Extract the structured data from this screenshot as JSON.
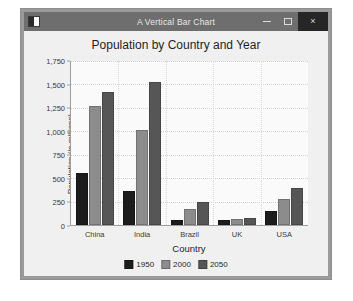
{
  "window": {
    "title": "A Vertical Bar Chart",
    "icon": "app-window-icon",
    "minimize_label": "–",
    "maximize_label": "□",
    "close_label": "×",
    "titlebar_color": "#6e6e6e",
    "close_button_color": "#262626",
    "frame_color": "#9a9a9a",
    "client_color": "#f0f0f0"
  },
  "chart_data": {
    "type": "bar",
    "title": "Population by Country and Year",
    "xlabel": "Country",
    "ylabel": "Population (in millions)",
    "categories": [
      "China",
      "India",
      "Brazil",
      "UK",
      "USA"
    ],
    "series": [
      {
        "name": "1950",
        "color": "#1c1c1c",
        "values": [
          555,
          360,
          55,
          50,
          150
        ]
      },
      {
        "name": "2000",
        "color": "#8c8c8c",
        "values": [
          1275,
          1010,
          175,
          60,
          280
        ]
      },
      {
        "name": "2050",
        "color": "#565656",
        "values": [
          1420,
          1530,
          245,
          70,
          400
        ]
      }
    ],
    "ylim": [
      0,
      1750
    ],
    "yticks": [
      0,
      250,
      500,
      750,
      1000,
      1250,
      1500,
      1750
    ],
    "ytick_labels": [
      "0",
      "250",
      "500",
      "750",
      "1,000",
      "1,250",
      "1,500",
      "1,750"
    ],
    "grid": true,
    "legend_position": "bottom"
  }
}
